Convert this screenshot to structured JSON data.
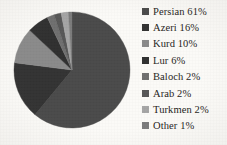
{
  "chart_data": {
    "type": "pie",
    "title": "",
    "categories": [
      "Persian",
      "Azeri",
      "Kurd",
      "Lur",
      "Baloch",
      "Arab",
      "Turkmen",
      "Other"
    ],
    "values": [
      61,
      16,
      10,
      6,
      2,
      2,
      2,
      1
    ],
    "value_unit": "%",
    "legend_position": "right",
    "grid": false,
    "start_angle_deg": 0,
    "direction": "clockwise",
    "background_color": "#fbfaf7",
    "slices": [
      {
        "label": "Persian",
        "value": 61,
        "display": "Persian 61%",
        "color": "#4a4a4a"
      },
      {
        "label": "Azeri",
        "value": 16,
        "display": "Azeri 16%",
        "color": "#333333"
      },
      {
        "label": "Kurd",
        "value": 10,
        "display": "Kurd 10%",
        "color": "#8a8a8a"
      },
      {
        "label": "Lur",
        "value": 6,
        "display": "Lur 6%",
        "color": "#303030"
      },
      {
        "label": "Baloch",
        "value": 2,
        "display": "Baloch 2%",
        "color": "#6f6f6f"
      },
      {
        "label": "Arab",
        "value": 2,
        "display": "Arab 2%",
        "color": "#575757"
      },
      {
        "label": "Turkmen",
        "value": 2,
        "display": "Turkmen 2%",
        "color": "#a5a5a5"
      },
      {
        "label": "Other",
        "value": 1,
        "display": "Other 1%",
        "color": "#7b7b7b"
      }
    ]
  },
  "legend": {
    "items": [
      {
        "swatch_name": "legend-swatch-persian",
        "label": "Persian 61%",
        "color": "#4a4a4a"
      },
      {
        "swatch_name": "legend-swatch-azeri",
        "label": "Azeri 16%",
        "color": "#333333"
      },
      {
        "swatch_name": "legend-swatch-kurd",
        "label": "Kurd 10%",
        "color": "#8a8a8a"
      },
      {
        "swatch_name": "legend-swatch-lur",
        "label": "Lur 6%",
        "color": "#303030"
      },
      {
        "swatch_name": "legend-swatch-baloch",
        "label": "Baloch 2%",
        "color": "#6f6f6f"
      },
      {
        "swatch_name": "legend-swatch-arab",
        "label": "Arab 2%",
        "color": "#575757"
      },
      {
        "swatch_name": "legend-swatch-turkmen",
        "label": "Turkmen 2%",
        "color": "#a5a5a5"
      },
      {
        "swatch_name": "legend-swatch-other",
        "label": "Other 1%",
        "color": "#7b7b7b"
      }
    ]
  }
}
